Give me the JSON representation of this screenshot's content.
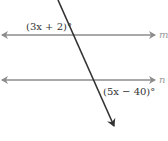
{
  "diagram": {
    "type": "parallel-lines-transversal",
    "lines": [
      {
        "name": "m",
        "label": "m",
        "y": 35
      },
      {
        "name": "n",
        "label": "n",
        "y": 80
      }
    ],
    "transversal": {
      "x1": 58,
      "y1": 0,
      "x2": 114,
      "y2": 127
    },
    "angles": [
      {
        "label": "(3x + 2)°",
        "at_line": "m",
        "position": "upper-left"
      },
      {
        "label": "(5x − 40)°",
        "at_line": "n",
        "position": "lower-right"
      }
    ],
    "colors": {
      "parallel_lines": "#8c8c8c",
      "transversal": "#333333",
      "label_text": "#333333",
      "line_label": "#9a9a9a"
    }
  }
}
